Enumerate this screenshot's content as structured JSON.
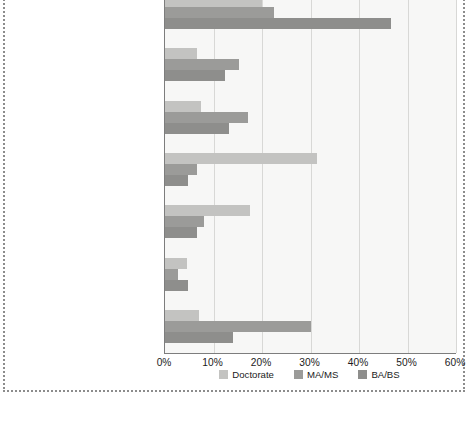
{
  "chart_data": {
    "type": "bar",
    "orientation": "horizontal",
    "title": "",
    "xlabel": "",
    "ylabel": "",
    "xlim": [
      0,
      60
    ],
    "xticks": [
      "0%",
      "10%",
      "20%",
      "30%",
      "40%",
      "50%",
      "60%"
    ],
    "xtick_values": [
      0,
      10,
      20,
      30,
      40,
      50,
      60
    ],
    "grid": true,
    "legend_position": "bottom-center",
    "categories": [
      "For-profit companies",
      "State or local government",
      "Not-for-profit organizations",
      "Universities and 4-year colleges",
      "Self-employed",
      "Federal government",
      "Other educational institutions"
    ],
    "series": [
      {
        "name": "Doctorate",
        "color": "#c3c3c1",
        "values": [
          20.0,
          6.6,
          7.4,
          31.3,
          17.5,
          4.5,
          7.0
        ]
      },
      {
        "name": "MA/MS",
        "color": "#9b9b99",
        "values": [
          22.5,
          15.2,
          17.1,
          6.6,
          8.0,
          2.7,
          30.1
        ]
      },
      {
        "name": "BA/BS",
        "color": "#8e8e8c",
        "values": [
          46.6,
          12.4,
          13.2,
          4.7,
          6.6,
          4.7,
          14.0
        ]
      }
    ]
  },
  "legend": {
    "items": [
      {
        "label": "Doctorate",
        "key": "doctorate"
      },
      {
        "label": "MA/MS",
        "key": "mams"
      },
      {
        "label": "BA/BS",
        "key": "babs"
      }
    ]
  }
}
